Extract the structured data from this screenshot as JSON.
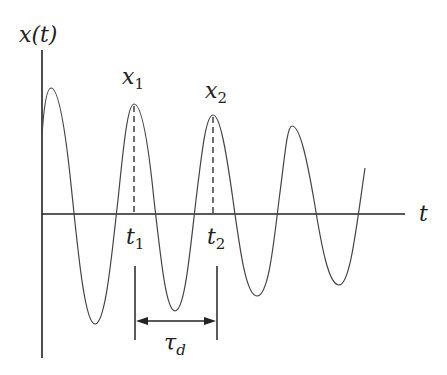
{
  "diagram": {
    "y_axis_label": "x(t)",
    "x_axis_label": "t",
    "peaks": [
      {
        "label": "x",
        "subscript": "1"
      },
      {
        "label": "x",
        "subscript": "2"
      }
    ],
    "times": [
      {
        "label": "t",
        "subscript": "1"
      },
      {
        "label": "t",
        "subscript": "2"
      }
    ],
    "period": {
      "label": "τ",
      "subscript": "d"
    }
  }
}
